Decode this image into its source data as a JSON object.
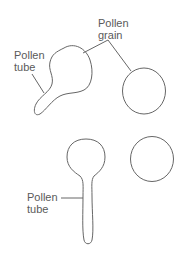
{
  "diagram": {
    "labels": {
      "pollen_grain_line1": "Pollen",
      "pollen_grain_line2": "grain",
      "pollen_tube_top_line1": "Pollen",
      "pollen_tube_top_line2": "tube",
      "pollen_tube_bottom_line1": "Pollen",
      "pollen_tube_bottom_line2": "tube"
    },
    "colors": {
      "stroke": "#666666",
      "text": "#5a5a5a",
      "background": "#ffffff"
    }
  }
}
